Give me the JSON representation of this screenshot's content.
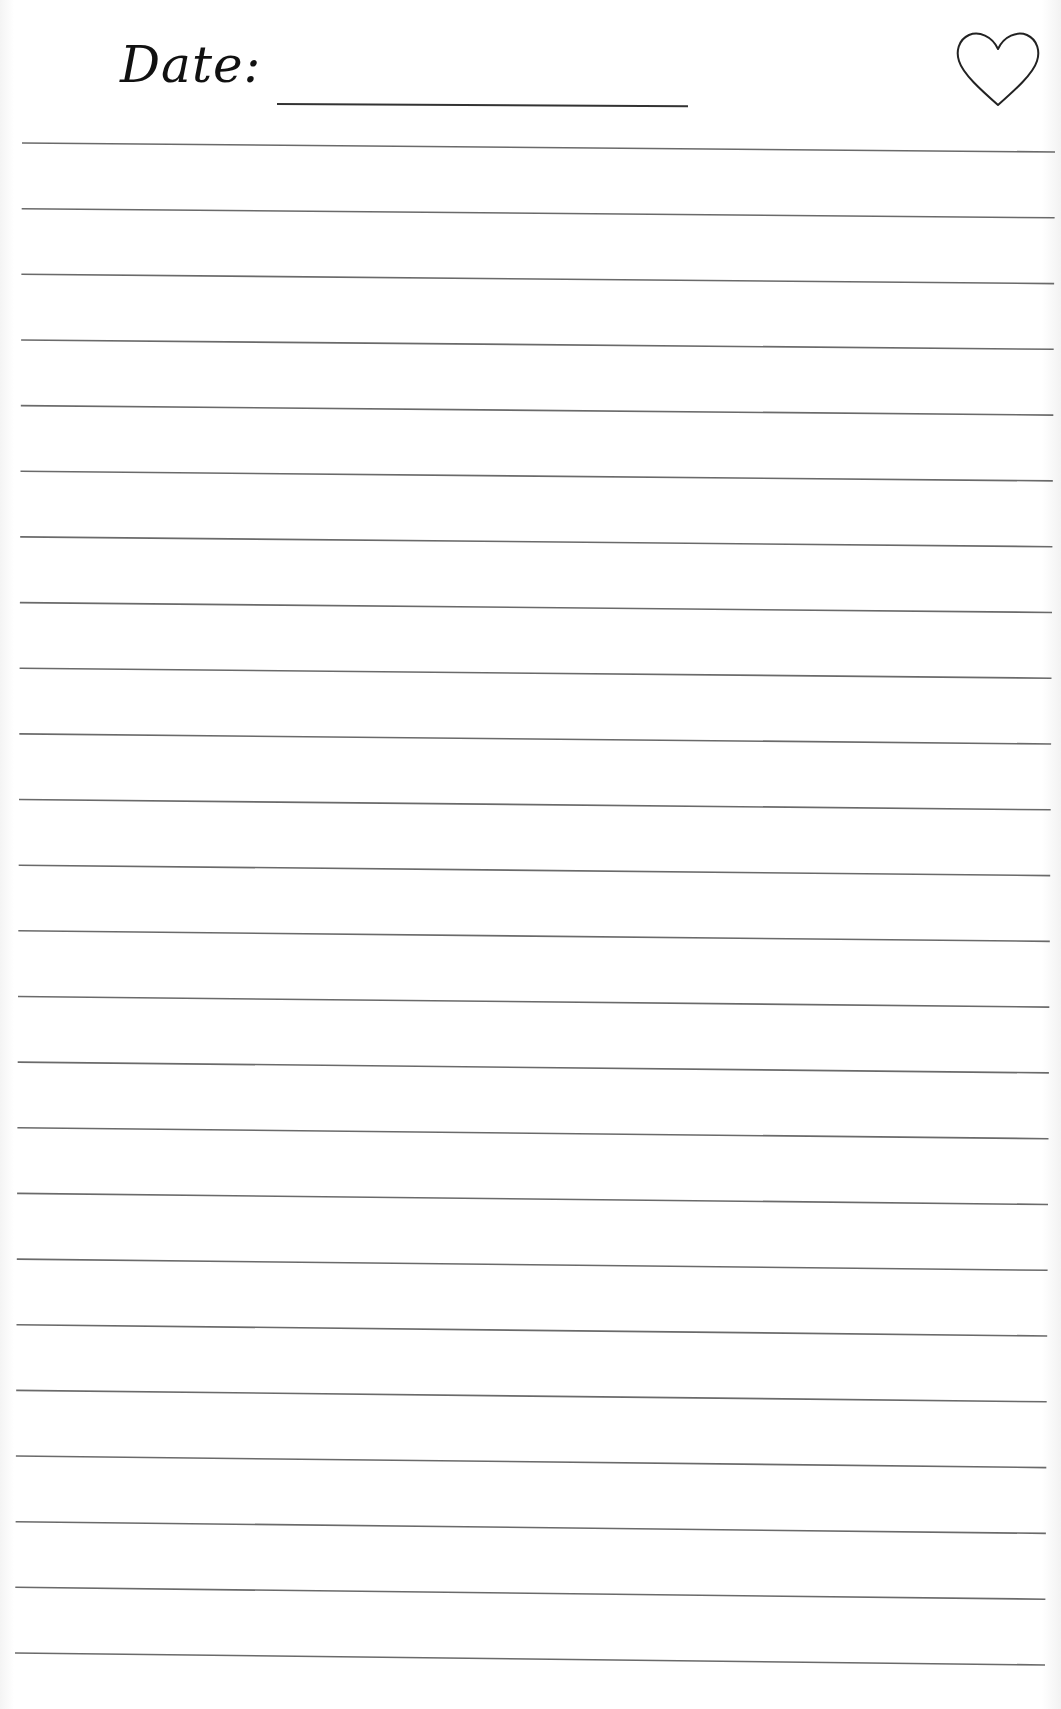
{
  "header": {
    "date_label": "Date:",
    "date_value": "",
    "icon": "heart-outline-icon"
  },
  "lines": {
    "count": 24,
    "first_left_y": 143,
    "first_right_y": 152,
    "spacing": 65.65,
    "left_x_top": 22,
    "left_x_bottom": 15,
    "right_x_top": 1055,
    "right_x_bottom": 1045,
    "color": "#6a6a6a"
  },
  "colors": {
    "ink": "#111111",
    "rule": "#6a6a6a",
    "paper": "#ffffff"
  }
}
